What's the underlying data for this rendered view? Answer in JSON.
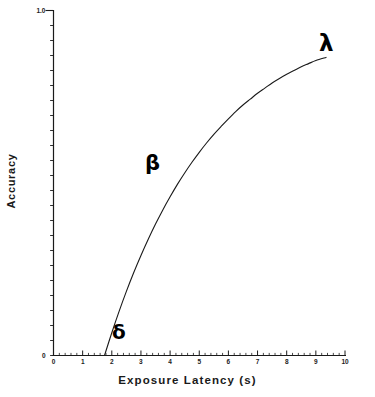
{
  "chart_data": {
    "type": "line",
    "title": "",
    "xlabel": "Exposure Latency (s)",
    "ylabel": "Accuracy",
    "xlim": [
      0,
      10
    ],
    "ylim": [
      0,
      1.0
    ],
    "grid": false,
    "legend": null,
    "x_tick_labels": [
      "0",
      "1",
      "2",
      "3",
      "4",
      "5",
      "6",
      "7",
      "8",
      "9",
      "10"
    ],
    "x_tick_values": [
      0,
      1,
      2,
      3,
      4,
      5,
      6,
      7,
      8,
      9,
      10
    ],
    "x_minor_ticks_per_interval": 5,
    "y_tick_labels": [
      "0",
      "1.0"
    ],
    "y_tick_values": [
      0,
      1.0
    ],
    "y_minor_tick_count": 23,
    "series": [
      {
        "name": "accuracy-curve",
        "color": "#1a1a1a",
        "x": [
          1.75,
          2.0,
          2.25,
          2.5,
          2.75,
          3.0,
          3.25,
          3.5,
          3.75,
          4.0,
          4.25,
          4.5,
          4.75,
          5.0,
          5.25,
          5.5,
          5.75,
          6.0,
          6.25,
          6.5,
          6.75,
          7.0,
          7.25,
          7.5,
          7.75,
          8.0,
          8.25,
          8.5,
          8.75,
          9.0,
          9.35
        ],
        "y": [
          0.0,
          0.066,
          0.128,
          0.186,
          0.24,
          0.29,
          0.337,
          0.381,
          0.422,
          0.46,
          0.496,
          0.529,
          0.56,
          0.589,
          0.616,
          0.641,
          0.664,
          0.686,
          0.707,
          0.726,
          0.743,
          0.76,
          0.775,
          0.79,
          0.803,
          0.815,
          0.826,
          0.837,
          0.846,
          0.855,
          0.864
        ]
      }
    ],
    "annotations": [
      {
        "name": "delta",
        "symbol": "δ",
        "x": 2.1,
        "y": 0.04,
        "meaning": "onset-of-curve"
      },
      {
        "name": "beta",
        "symbol": "β",
        "x": 3.25,
        "y": 0.56,
        "meaning": "rate-of-rise"
      },
      {
        "name": "lambda",
        "symbol": "λ",
        "x": 9.25,
        "y": 0.94,
        "meaning": "asymptote"
      }
    ]
  },
  "axes": {
    "x_axis_label": "Exposure Latency (s)",
    "y_axis_label": "Accuracy",
    "y_top_label": "1.0",
    "y_bottom_label": "0"
  },
  "colors": {
    "background": "#ffffff",
    "axis": "#1a1a1a",
    "curve": "#1a1a1a",
    "text": "#1a1a1a"
  }
}
